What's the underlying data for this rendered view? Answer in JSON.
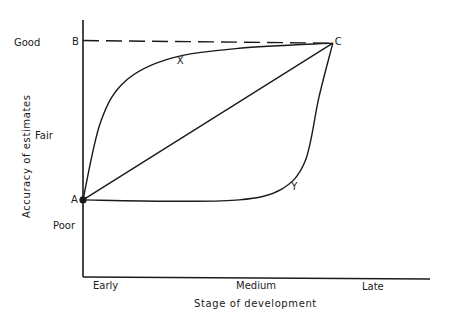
{
  "chart_data": {
    "type": "line",
    "title": "",
    "xlabel": "Stage of development",
    "ylabel": "Accuracy of estimates",
    "x_ticks": [
      "Early",
      "Medium",
      "Late"
    ],
    "y_ticks": [
      "Poor",
      "Fair",
      "Good"
    ],
    "xlim": [
      0,
      1
    ],
    "ylim": [
      0,
      1
    ],
    "points": [
      {
        "label": "A",
        "x": 0.0,
        "y": 0.3,
        "marker": true
      },
      {
        "label": "B",
        "x": 0.0,
        "y": 0.92,
        "marker": false
      },
      {
        "label": "C",
        "x": 0.72,
        "y": 0.91,
        "marker": false
      }
    ],
    "series": [
      {
        "name": "B-C",
        "style": "dashed",
        "description": "Good accuracy reference line",
        "points": [
          [
            0.0,
            0.92
          ],
          [
            0.72,
            0.91
          ]
        ]
      },
      {
        "name": "A-C",
        "style": "solid",
        "description": "Straight line from A to C",
        "points": [
          [
            0.0,
            0.3
          ],
          [
            0.72,
            0.91
          ]
        ]
      },
      {
        "name": "X",
        "style": "solid",
        "description": "Curve rising quickly then flattening",
        "points": [
          [
            0.0,
            0.3
          ],
          [
            0.05,
            0.6
          ],
          [
            0.12,
            0.76
          ],
          [
            0.25,
            0.85
          ],
          [
            0.45,
            0.89
          ],
          [
            0.72,
            0.91
          ]
        ]
      },
      {
        "name": "Y",
        "style": "solid",
        "description": "Curve staying low then rising sharply late",
        "points": [
          [
            0.0,
            0.3
          ],
          [
            0.25,
            0.295
          ],
          [
            0.45,
            0.3
          ],
          [
            0.57,
            0.34
          ],
          [
            0.64,
            0.45
          ],
          [
            0.68,
            0.7
          ],
          [
            0.72,
            0.91
          ]
        ]
      }
    ],
    "curve_labels": [
      {
        "text": "X",
        "x": 0.27,
        "y": 0.83
      },
      {
        "text": "Y",
        "x": 0.6,
        "y": 0.34
      }
    ],
    "grid": false,
    "legend": "none"
  }
}
